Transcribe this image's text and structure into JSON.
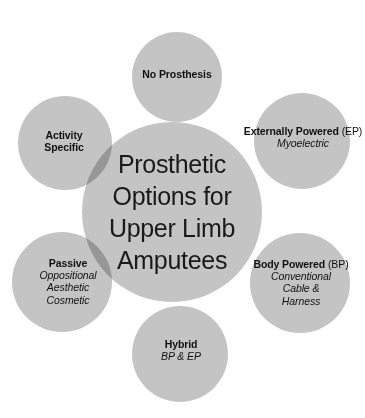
{
  "figure": {
    "name": "prosthetic-options-circle-diagram",
    "background_color": "#ffffff",
    "circle_fill": "#c4c4c4",
    "overlap_fill": "#a3a3a3",
    "text_color": "#111111"
  },
  "center": {
    "label": "Prosthetic Options for Upper Limb Amputees",
    "lines": [
      "Prosthetic",
      "Options for",
      "Upper Limb",
      "Amputees"
    ]
  },
  "satellites": [
    {
      "id": "no-prosthesis",
      "title": "No Prosthesis",
      "title_suffix": "",
      "sub_lines": []
    },
    {
      "id": "externally-powered",
      "title": "Externally Powered",
      "title_suffix": "(EP)",
      "sub_lines": [
        "Myoelectric"
      ]
    },
    {
      "id": "body-powered",
      "title": "Body Powered",
      "title_suffix": "(BP)",
      "sub_lines": [
        "Conventional",
        "Cable &",
        "Harness"
      ]
    },
    {
      "id": "hybrid",
      "title": "Hybrid",
      "title_suffix": "",
      "sub_lines": [
        "BP & EP"
      ]
    },
    {
      "id": "passive",
      "title": "Passive",
      "title_suffix": "",
      "sub_lines": [
        "Oppositional",
        "Aesthetic",
        "Cosmetic"
      ]
    },
    {
      "id": "activity-specific",
      "title": "Activity Specific",
      "title_suffix": "",
      "sub_lines": []
    }
  ]
}
